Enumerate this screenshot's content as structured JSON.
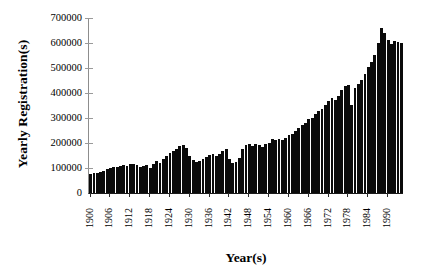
{
  "chart_data": {
    "type": "bar",
    "title": "",
    "xlabel": "Year(s)",
    "ylabel": "Yearly Registration(s)",
    "ylim": [
      0,
      700000
    ],
    "yticks": [
      0,
      100000,
      200000,
      300000,
      400000,
      500000,
      600000,
      700000
    ],
    "ytick_labels": [
      "0",
      "100000",
      "200000",
      "300000",
      "400000",
      "500000",
      "600000",
      "700000"
    ],
    "xtick_labels": [
      "1900",
      "1906",
      "1912",
      "1918",
      "1924",
      "1930",
      "1936",
      "1942",
      "1948",
      "1954",
      "1960",
      "1966",
      "1972",
      "1978",
      "1984",
      "1990"
    ],
    "xtick_step_years": 6,
    "grid": false,
    "legend": null,
    "bar_color": "#0a0a0a",
    "background_color": "#ffffff",
    "x": [
      1900,
      1901,
      1902,
      1903,
      1904,
      1905,
      1906,
      1907,
      1908,
      1909,
      1910,
      1911,
      1912,
      1913,
      1914,
      1915,
      1916,
      1917,
      1918,
      1919,
      1920,
      1921,
      1922,
      1923,
      1924,
      1925,
      1926,
      1927,
      1928,
      1929,
      1930,
      1931,
      1932,
      1933,
      1934,
      1935,
      1936,
      1937,
      1938,
      1939,
      1940,
      1941,
      1942,
      1943,
      1944,
      1945,
      1946,
      1947,
      1948,
      1949,
      1950,
      1951,
      1952,
      1953,
      1954,
      1955,
      1956,
      1957,
      1958,
      1959,
      1960,
      1961,
      1962,
      1963,
      1964,
      1965,
      1966,
      1967,
      1968,
      1969,
      1970,
      1971,
      1972,
      1973,
      1974,
      1975,
      1976,
      1977,
      1978,
      1979,
      1980,
      1981,
      1982,
      1983,
      1984,
      1985,
      1986,
      1987,
      1988,
      1989,
      1990,
      1991,
      1992,
      1993,
      1994
    ],
    "values": [
      78000,
      82000,
      80000,
      86000,
      90000,
      95000,
      100000,
      106000,
      103000,
      108000,
      112000,
      110000,
      115000,
      118000,
      112000,
      105000,
      108000,
      112000,
      100000,
      118000,
      128000,
      120000,
      135000,
      150000,
      162000,
      170000,
      178000,
      188000,
      192000,
      180000,
      150000,
      132000,
      126000,
      130000,
      138000,
      145000,
      152000,
      158000,
      150000,
      156000,
      168000,
      175000,
      138000,
      120000,
      126000,
      140000,
      178000,
      192000,
      196000,
      188000,
      198000,
      192000,
      186000,
      195000,
      200000,
      215000,
      212000,
      218000,
      214000,
      222000,
      232000,
      238000,
      248000,
      262000,
      272000,
      282000,
      296000,
      302000,
      318000,
      330000,
      338000,
      352000,
      368000,
      382000,
      374000,
      388000,
      412000,
      428000,
      432000,
      352000,
      420000,
      438000,
      452000,
      478000,
      505000,
      525000,
      552000,
      600000,
      660000,
      640000,
      612000,
      598000,
      608000,
      604000,
      600000
    ]
  }
}
